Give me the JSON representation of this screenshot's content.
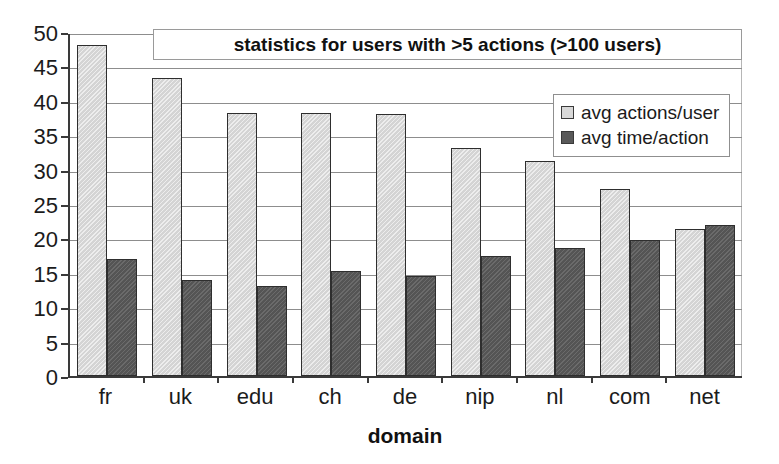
{
  "chart_data": {
    "type": "bar",
    "title": "statistics for users with >5 actions (>100 users)",
    "xlabel": "domain",
    "ylabel": "",
    "ylim": [
      0,
      50
    ],
    "ytick_step": 5,
    "yticks": [
      50,
      45,
      40,
      35,
      30,
      25,
      20,
      15,
      10,
      5,
      0
    ],
    "grid": true,
    "legend_position": "upper-right-inside",
    "categories": [
      "fr",
      "uk",
      "edu",
      "ch",
      "de",
      "nip",
      "nl",
      "com",
      "net"
    ],
    "series": [
      {
        "name": "avg actions/user",
        "color": "#d8d8d8",
        "values": [
          48.1,
          43.3,
          38.3,
          38.3,
          38.1,
          33.2,
          31.2,
          27.2,
          21.4
        ]
      },
      {
        "name": "avg time/action",
        "color": "#595959",
        "values": [
          17.0,
          13.9,
          13.1,
          15.3,
          14.6,
          17.5,
          18.6,
          19.7,
          21.9
        ]
      }
    ]
  }
}
